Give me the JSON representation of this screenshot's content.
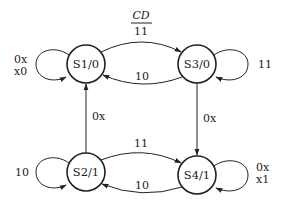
{
  "diagram": {
    "type": "state-machine",
    "input_header": {
      "label": "CD",
      "first_value": "11"
    },
    "states": [
      {
        "id": "S1",
        "label": "S1/0",
        "output": "0"
      },
      {
        "id": "S2",
        "label": "S2/1",
        "output": "1"
      },
      {
        "id": "S3",
        "label": "S3/0",
        "output": "0"
      },
      {
        "id": "S4",
        "label": "S4/1",
        "output": "1"
      }
    ],
    "transitions": [
      {
        "from": "S1",
        "to": "S1",
        "label_line1": "0x",
        "label_line2": "x0"
      },
      {
        "from": "S1",
        "to": "S3",
        "label": "11"
      },
      {
        "from": "S3",
        "to": "S1",
        "label": "10"
      },
      {
        "from": "S3",
        "to": "S3",
        "label": "11"
      },
      {
        "from": "S3",
        "to": "S4",
        "label": "0x"
      },
      {
        "from": "S2",
        "to": "S1",
        "label": "0x"
      },
      {
        "from": "S2",
        "to": "S2",
        "label": "10"
      },
      {
        "from": "S2",
        "to": "S4",
        "label": "11"
      },
      {
        "from": "S4",
        "to": "S2",
        "label": "10"
      },
      {
        "from": "S4",
        "to": "S4",
        "label_line1": "0x",
        "label_line2": "x1"
      }
    ]
  }
}
